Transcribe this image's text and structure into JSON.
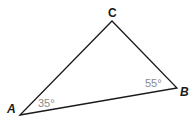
{
  "diagram": {
    "type": "triangle",
    "vertices": [
      {
        "id": "A",
        "label": "A",
        "x": 20,
        "y": 115
      },
      {
        "id": "B",
        "label": "B",
        "x": 177,
        "y": 88
      },
      {
        "id": "C",
        "label": "C",
        "x": 112,
        "y": 21
      }
    ],
    "angles": [
      {
        "vertex": "A",
        "label": "35°"
      },
      {
        "vertex": "B",
        "label": "55°"
      }
    ],
    "stroke_color": "#1a1a1a",
    "angle_label_color": "#8a8a8a"
  }
}
